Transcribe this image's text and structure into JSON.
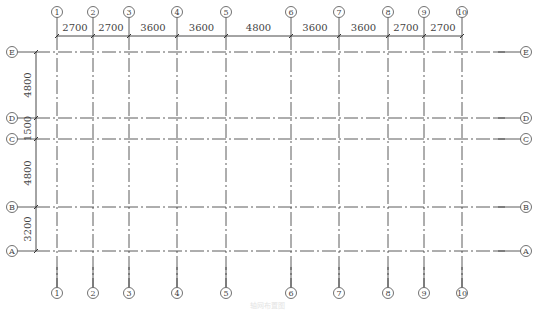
{
  "drawing": {
    "type": "structural-axis-grid-plan",
    "caption": "轴网布置图",
    "colors": {
      "line": "#333333",
      "text": "#444444",
      "background": "#ffffff"
    },
    "columns": [
      {
        "label": "1",
        "x": 57
      },
      {
        "label": "2",
        "x": 93
      },
      {
        "label": "3",
        "x": 129
      },
      {
        "label": "4",
        "x": 177
      },
      {
        "label": "5",
        "x": 226
      },
      {
        "label": "6",
        "x": 291
      },
      {
        "label": "7",
        "x": 339
      },
      {
        "label": "8",
        "x": 388
      },
      {
        "label": "9",
        "x": 424
      },
      {
        "label": "10",
        "x": 462
      }
    ],
    "column_spacings": [
      "2700",
      "2700",
      "3600",
      "3600",
      "4800",
      "3600",
      "3600",
      "2700",
      "2700"
    ],
    "rows": [
      {
        "label": "E",
        "y": 52
      },
      {
        "label": "D",
        "y": 118
      },
      {
        "label": "C",
        "y": 139
      },
      {
        "label": "B",
        "y": 207
      },
      {
        "label": "A",
        "y": 251
      }
    ],
    "row_spacings": [
      "4800",
      "1500",
      "4800",
      "3200"
    ],
    "layout": {
      "top_bubble_y": 12,
      "bottom_bubble_y": 293,
      "left_bubble_x": 12,
      "right_bubble_x": 526,
      "bubble_r": 5.5,
      "top_dim_y": 36,
      "left_dim_x": 36
    }
  }
}
